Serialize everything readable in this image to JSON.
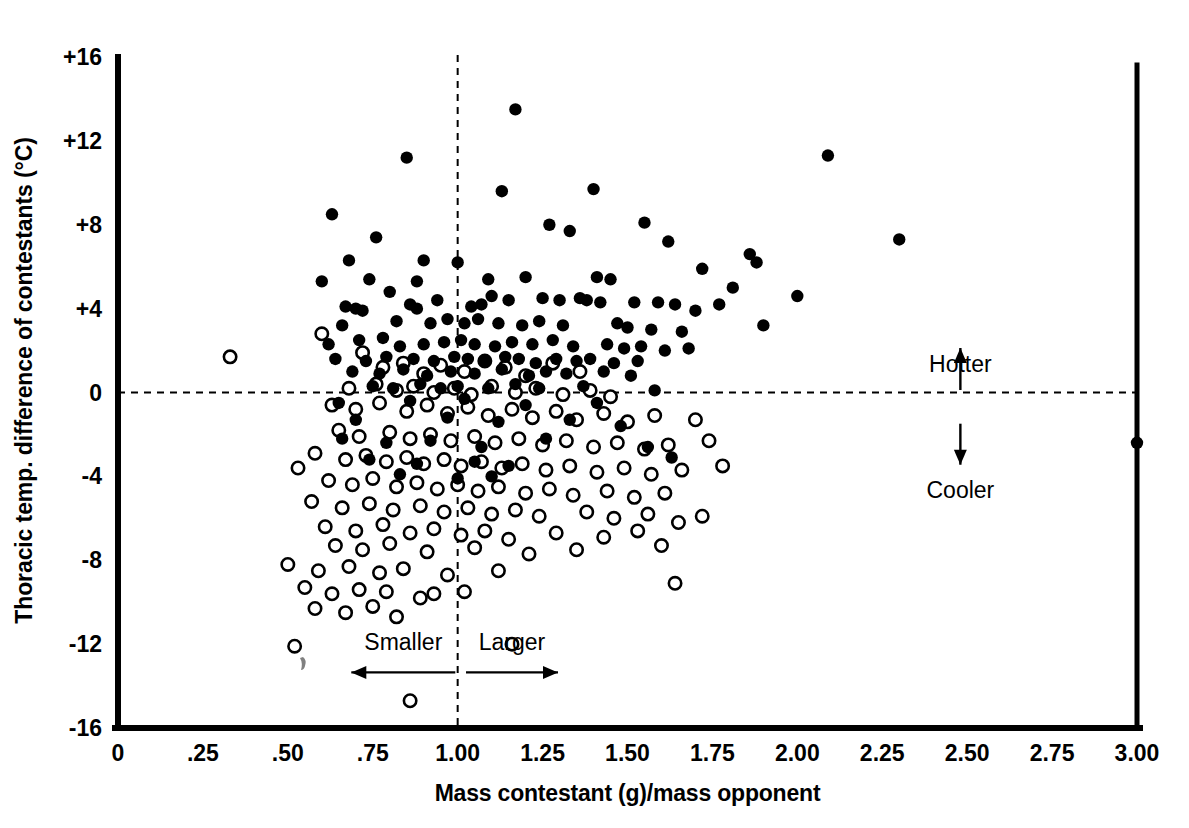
{
  "chart_data": {
    "type": "scatter",
    "title": "",
    "xlabel": "Mass contestant (g)/mass opponent",
    "ylabel": "Thoracic temp. difference of contestants (°C)",
    "xlim": [
      0,
      3.0
    ],
    "ylim": [
      -16,
      16
    ],
    "xticks": [
      0,
      0.25,
      0.5,
      0.75,
      1.0,
      1.25,
      1.5,
      1.75,
      2.0,
      2.25,
      2.5,
      2.75,
      3.0
    ],
    "xtick_labels": [
      "0",
      ".25",
      ".50",
      ".75",
      "1.00",
      "1.25",
      "1.50",
      "1.75",
      "2.00",
      "2.25",
      "2.50",
      "2.75",
      "3.00"
    ],
    "yticks": [
      16,
      12,
      8,
      4,
      0,
      -4,
      -8,
      -12,
      -16
    ],
    "ytick_labels": [
      "+16",
      "+12",
      "+8",
      "+4",
      "0",
      "-4",
      "-8",
      "-12",
      "-16"
    ],
    "grid": false,
    "legend": "none",
    "reference_lines": [
      {
        "name": "zero-temperature-difference",
        "orientation": "horizontal",
        "value": 0,
        "style": "dashed"
      },
      {
        "name": "equal-mass-ratio",
        "orientation": "vertical",
        "value": 1.0,
        "style": "dashed"
      }
    ],
    "annotations": [
      {
        "name": "hotter",
        "text": "Hotter",
        "x": 2.48,
        "y": 2.6,
        "arrow": "up"
      },
      {
        "name": "cooler",
        "text": "Cooler",
        "x": 2.48,
        "y": -3.3,
        "arrow": "down"
      },
      {
        "name": "smaller",
        "text": "Smaller",
        "x": 0.84,
        "y": -12.3,
        "arrow": "left"
      },
      {
        "name": "larger",
        "text": "Larger",
        "x": 1.16,
        "y": -12.3,
        "arrow": "right"
      }
    ],
    "series": [
      {
        "name": "Winner (filled circles)",
        "marker": "filled-circle",
        "color": "#000000",
        "points": [
          [
            1.17,
            13.5
          ],
          [
            0.85,
            11.2
          ],
          [
            2.09,
            11.3
          ],
          [
            0.63,
            8.5
          ],
          [
            1.13,
            9.6
          ],
          [
            1.4,
            9.7
          ],
          [
            2.3,
            7.3
          ],
          [
            1.27,
            8.0
          ],
          [
            1.55,
            8.1
          ],
          [
            1.33,
            7.7
          ],
          [
            0.76,
            7.4
          ],
          [
            0.68,
            6.3
          ],
          [
            1.0,
            6.2
          ],
          [
            0.9,
            6.3
          ],
          [
            1.62,
            7.2
          ],
          [
            1.72,
            5.9
          ],
          [
            1.86,
            6.6
          ],
          [
            1.88,
            6.2
          ],
          [
            0.6,
            5.3
          ],
          [
            0.74,
            5.4
          ],
          [
            0.88,
            5.3
          ],
          [
            1.09,
            5.4
          ],
          [
            1.2,
            5.5
          ],
          [
            1.41,
            5.5
          ],
          [
            1.45,
            5.4
          ],
          [
            1.81,
            5.0
          ],
          [
            2.0,
            4.6
          ],
          [
            1.52,
            4.3
          ],
          [
            1.1,
            4.6
          ],
          [
            0.8,
            4.8
          ],
          [
            0.67,
            4.1
          ],
          [
            0.7,
            4.0
          ],
          [
            0.72,
            3.9
          ],
          [
            0.86,
            4.2
          ],
          [
            0.88,
            4.0
          ],
          [
            0.94,
            4.4
          ],
          [
            1.04,
            4.1
          ],
          [
            1.07,
            4.2
          ],
          [
            1.15,
            4.4
          ],
          [
            1.25,
            4.5
          ],
          [
            1.3,
            4.4
          ],
          [
            1.36,
            4.5
          ],
          [
            1.38,
            4.4
          ],
          [
            1.42,
            4.3
          ],
          [
            1.59,
            4.3
          ],
          [
            1.64,
            4.2
          ],
          [
            1.7,
            3.9
          ],
          [
            1.77,
            4.2
          ],
          [
            1.9,
            3.2
          ],
          [
            0.66,
            3.2
          ],
          [
            0.82,
            3.4
          ],
          [
            0.92,
            3.3
          ],
          [
            0.97,
            3.5
          ],
          [
            1.02,
            3.3
          ],
          [
            1.06,
            3.5
          ],
          [
            1.12,
            3.3
          ],
          [
            1.19,
            3.2
          ],
          [
            1.24,
            3.4
          ],
          [
            1.31,
            3.2
          ],
          [
            1.47,
            3.3
          ],
          [
            1.5,
            3.1
          ],
          [
            1.57,
            3.0
          ],
          [
            1.66,
            2.9
          ],
          [
            0.62,
            2.3
          ],
          [
            0.71,
            2.5
          ],
          [
            0.78,
            2.6
          ],
          [
            0.83,
            2.2
          ],
          [
            0.9,
            2.3
          ],
          [
            0.96,
            2.4
          ],
          [
            1.01,
            2.5
          ],
          [
            1.05,
            2.3
          ],
          [
            1.11,
            2.2
          ],
          [
            1.16,
            2.4
          ],
          [
            1.22,
            2.3
          ],
          [
            1.28,
            2.5
          ],
          [
            1.34,
            2.2
          ],
          [
            1.44,
            2.3
          ],
          [
            1.49,
            2.1
          ],
          [
            1.54,
            2.2
          ],
          [
            1.61,
            2.0
          ],
          [
            1.68,
            2.1
          ],
          [
            0.64,
            1.6
          ],
          [
            0.73,
            1.5
          ],
          [
            0.79,
            1.7
          ],
          [
            0.87,
            1.6
          ],
          [
            0.93,
            1.5
          ],
          [
            0.99,
            1.7
          ],
          [
            1.03,
            1.6
          ],
          [
            1.08,
            1.5
          ],
          [
            1.14,
            1.7
          ],
          [
            1.18,
            1.6
          ],
          [
            1.23,
            1.4
          ],
          [
            1.29,
            1.6
          ],
          [
            1.35,
            1.5
          ],
          [
            1.39,
            1.6
          ],
          [
            1.46,
            1.4
          ],
          [
            1.53,
            1.5
          ],
          [
            0.69,
            1.0
          ],
          [
            0.77,
            0.9
          ],
          [
            0.84,
            1.1
          ],
          [
            0.91,
            0.8
          ],
          [
            0.98,
            1.0
          ],
          [
            1.05,
            0.9
          ],
          [
            1.13,
            1.1
          ],
          [
            1.21,
            0.8
          ],
          [
            1.26,
            1.0
          ],
          [
            1.32,
            0.9
          ],
          [
            1.43,
            1.0
          ],
          [
            1.51,
            0.8
          ],
          [
            0.75,
            0.3
          ],
          [
            0.81,
            0.2
          ],
          [
            0.89,
            0.4
          ],
          [
            0.95,
            0.2
          ],
          [
            1.0,
            0.3
          ],
          [
            1.09,
            0.2
          ],
          [
            1.17,
            0.4
          ],
          [
            1.24,
            0.2
          ],
          [
            1.37,
            0.3
          ],
          [
            1.58,
            0.1
          ],
          [
            0.65,
            -0.5
          ],
          [
            0.86,
            -0.4
          ],
          [
            1.02,
            -0.3
          ],
          [
            1.2,
            -0.6
          ],
          [
            1.41,
            -0.5
          ],
          [
            0.7,
            -1.3
          ],
          [
            0.97,
            -1.2
          ],
          [
            1.12,
            -1.4
          ],
          [
            1.33,
            -1.3
          ],
          [
            1.48,
            -1.6
          ],
          [
            0.66,
            -2.2
          ],
          [
            0.79,
            -2.4
          ],
          [
            0.92,
            -2.3
          ],
          [
            1.07,
            -2.6
          ],
          [
            1.26,
            -2.2
          ],
          [
            1.63,
            -3.1
          ],
          [
            1.56,
            -2.6
          ],
          [
            0.74,
            -3.2
          ],
          [
            0.88,
            -3.4
          ],
          [
            1.05,
            -3.3
          ],
          [
            1.15,
            -3.5
          ],
          [
            0.83,
            -3.9
          ],
          [
            1.0,
            -4.1
          ],
          [
            1.1,
            -4.0
          ],
          [
            3.0,
            -2.4
          ]
        ]
      },
      {
        "name": "Loser (open circles)",
        "marker": "open-circle",
        "color": "#000000",
        "points": [
          [
            0.33,
            1.7
          ],
          [
            0.6,
            2.8
          ],
          [
            0.72,
            1.9
          ],
          [
            0.78,
            1.2
          ],
          [
            0.84,
            1.4
          ],
          [
            0.9,
            0.9
          ],
          [
            0.95,
            1.3
          ],
          [
            1.02,
            1.0
          ],
          [
            1.08,
            1.5
          ],
          [
            1.14,
            1.2
          ],
          [
            1.2,
            0.8
          ],
          [
            1.28,
            1.4
          ],
          [
            1.36,
            1.0
          ],
          [
            0.68,
            0.2
          ],
          [
            0.76,
            0.4
          ],
          [
            0.82,
            0.1
          ],
          [
            0.87,
            0.3
          ],
          [
            0.93,
            0.0
          ],
          [
            0.99,
            0.2
          ],
          [
            1.04,
            -0.1
          ],
          [
            1.1,
            0.3
          ],
          [
            1.17,
            0.0
          ],
          [
            1.23,
            0.2
          ],
          [
            1.31,
            -0.1
          ],
          [
            1.39,
            0.1
          ],
          [
            1.45,
            -0.2
          ],
          [
            0.63,
            -0.6
          ],
          [
            0.7,
            -0.8
          ],
          [
            0.77,
            -0.5
          ],
          [
            0.85,
            -0.9
          ],
          [
            0.91,
            -0.6
          ],
          [
            0.97,
            -1.0
          ],
          [
            1.03,
            -0.7
          ],
          [
            1.09,
            -1.1
          ],
          [
            1.16,
            -0.8
          ],
          [
            1.22,
            -1.2
          ],
          [
            1.29,
            -0.9
          ],
          [
            1.35,
            -1.3
          ],
          [
            1.43,
            -1.0
          ],
          [
            1.5,
            -1.4
          ],
          [
            1.58,
            -1.1
          ],
          [
            1.7,
            -1.3
          ],
          [
            0.65,
            -1.8
          ],
          [
            0.71,
            -2.1
          ],
          [
            0.8,
            -1.9
          ],
          [
            0.86,
            -2.2
          ],
          [
            0.92,
            -2.0
          ],
          [
            0.98,
            -2.3
          ],
          [
            1.05,
            -2.1
          ],
          [
            1.11,
            -2.4
          ],
          [
            1.18,
            -2.2
          ],
          [
            1.25,
            -2.5
          ],
          [
            1.32,
            -2.3
          ],
          [
            1.4,
            -2.6
          ],
          [
            1.47,
            -2.4
          ],
          [
            1.55,
            -2.7
          ],
          [
            1.62,
            -2.5
          ],
          [
            1.74,
            -2.3
          ],
          [
            0.58,
            -2.9
          ],
          [
            0.67,
            -3.2
          ],
          [
            0.73,
            -3.0
          ],
          [
            0.79,
            -3.3
          ],
          [
            0.85,
            -3.1
          ],
          [
            0.9,
            -3.4
          ],
          [
            0.96,
            -3.2
          ],
          [
            1.01,
            -3.5
          ],
          [
            1.07,
            -3.3
          ],
          [
            1.13,
            -3.6
          ],
          [
            1.19,
            -3.4
          ],
          [
            1.26,
            -3.7
          ],
          [
            1.33,
            -3.5
          ],
          [
            1.41,
            -3.8
          ],
          [
            1.49,
            -3.6
          ],
          [
            1.57,
            -3.9
          ],
          [
            1.66,
            -3.7
          ],
          [
            1.78,
            -3.5
          ],
          [
            0.53,
            -3.6
          ],
          [
            0.62,
            -4.2
          ],
          [
            0.69,
            -4.4
          ],
          [
            0.75,
            -4.1
          ],
          [
            0.82,
            -4.5
          ],
          [
            0.88,
            -4.3
          ],
          [
            0.94,
            -4.6
          ],
          [
            1.0,
            -4.4
          ],
          [
            1.06,
            -4.7
          ],
          [
            1.12,
            -4.5
          ],
          [
            1.2,
            -4.8
          ],
          [
            1.27,
            -4.6
          ],
          [
            1.34,
            -4.9
          ],
          [
            1.44,
            -4.7
          ],
          [
            1.52,
            -5.0
          ],
          [
            1.61,
            -4.8
          ],
          [
            0.57,
            -5.2
          ],
          [
            0.66,
            -5.5
          ],
          [
            0.74,
            -5.3
          ],
          [
            0.81,
            -5.6
          ],
          [
            0.89,
            -5.4
          ],
          [
            0.96,
            -5.7
          ],
          [
            1.03,
            -5.5
          ],
          [
            1.1,
            -5.8
          ],
          [
            1.17,
            -5.6
          ],
          [
            1.24,
            -5.9
          ],
          [
            1.38,
            -5.7
          ],
          [
            1.46,
            -6.0
          ],
          [
            1.56,
            -5.8
          ],
          [
            1.65,
            -6.2
          ],
          [
            1.72,
            -5.9
          ],
          [
            0.61,
            -6.4
          ],
          [
            0.7,
            -6.6
          ],
          [
            0.78,
            -6.3
          ],
          [
            0.86,
            -6.7
          ],
          [
            0.93,
            -6.5
          ],
          [
            1.01,
            -6.8
          ],
          [
            1.08,
            -6.6
          ],
          [
            1.15,
            -7.0
          ],
          [
            1.29,
            -6.7
          ],
          [
            1.43,
            -6.9
          ],
          [
            1.53,
            -6.6
          ],
          [
            0.64,
            -7.3
          ],
          [
            0.72,
            -7.5
          ],
          [
            0.8,
            -7.2
          ],
          [
            0.91,
            -7.6
          ],
          [
            1.05,
            -7.4
          ],
          [
            1.21,
            -7.7
          ],
          [
            1.35,
            -7.5
          ],
          [
            1.6,
            -7.3
          ],
          [
            0.5,
            -8.2
          ],
          [
            0.59,
            -8.5
          ],
          [
            0.68,
            -8.3
          ],
          [
            0.77,
            -8.6
          ],
          [
            0.84,
            -8.4
          ],
          [
            0.97,
            -8.7
          ],
          [
            1.12,
            -8.5
          ],
          [
            1.64,
            -9.1
          ],
          [
            0.55,
            -9.3
          ],
          [
            0.63,
            -9.6
          ],
          [
            0.71,
            -9.4
          ],
          [
            0.79,
            -9.5
          ],
          [
            0.89,
            -9.8
          ],
          [
            0.93,
            -9.6
          ],
          [
            1.02,
            -9.5
          ],
          [
            0.58,
            -10.3
          ],
          [
            0.67,
            -10.5
          ],
          [
            0.75,
            -10.2
          ],
          [
            0.82,
            -10.7
          ],
          [
            0.52,
            -12.1
          ],
          [
            1.16,
            -12.0
          ],
          [
            0.86,
            -14.7
          ]
        ]
      }
    ]
  },
  "geometry": {
    "left_px": 118,
    "right_px": 1137,
    "top_px": 57,
    "bottom_px": 728
  }
}
